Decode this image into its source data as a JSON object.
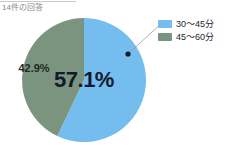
{
  "caption": "14件の回答",
  "colors": {
    "series_1": "#74bdee",
    "series_2": "#7a9480",
    "label_dark": "#111a2e",
    "caption_gray": "#8a8a8a",
    "leader_line": "#9a9a9a",
    "marker_dot": "#0d1a2b"
  },
  "legend": {
    "items": [
      {
        "label": "30〜45分",
        "color": "#74bdee"
      },
      {
        "label": "45〜60分",
        "color": "#7a9480"
      }
    ]
  },
  "labels": {
    "major": "57.1%",
    "minor": "42.9%"
  },
  "chart_data": {
    "type": "pie",
    "title": "",
    "subtitle": "14件の回答",
    "categories": [
      "30〜45分",
      "45〜60分"
    ],
    "values": [
      57.1,
      42.9
    ],
    "value_labels": [
      "57.1%",
      "42.9%"
    ],
    "counts": [
      8,
      6
    ],
    "total_responses": 14,
    "units": "%",
    "colors": [
      "#74bdee",
      "#7a9480"
    ],
    "start_angle_deg": 0,
    "direction": "clockwise",
    "legend_position": "right",
    "grid": false,
    "annotations": [
      {
        "type": "marker-with-leader-line",
        "target_series": "30〜45分",
        "dot_x": 128,
        "dot_y": 54,
        "line_to_x": 163,
        "line_to_y": 22
      }
    ],
    "geometry": {
      "center_x": 84,
      "center_y": 80,
      "radius": 62
    }
  }
}
